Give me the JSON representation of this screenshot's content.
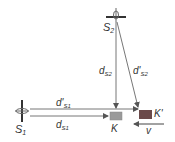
{
  "diagram": {
    "nodes": {
      "S1": {
        "label": "S",
        "sub": "1"
      },
      "S2": {
        "label": "S",
        "sub": "2"
      },
      "K": {
        "label": "K",
        "color": "#9a9a9a"
      },
      "Kprime": {
        "label": "K'",
        "color": "#6b4a4a"
      }
    },
    "edges": {
      "dS1": {
        "label": "d",
        "sub": "S1"
      },
      "dS1prime": {
        "label": "d'",
        "sub": "S1"
      },
      "dS2": {
        "label": "d",
        "sub": "S2"
      },
      "dS2prime": {
        "label": "d'",
        "sub": "S2"
      },
      "v": {
        "label": "v"
      }
    }
  }
}
